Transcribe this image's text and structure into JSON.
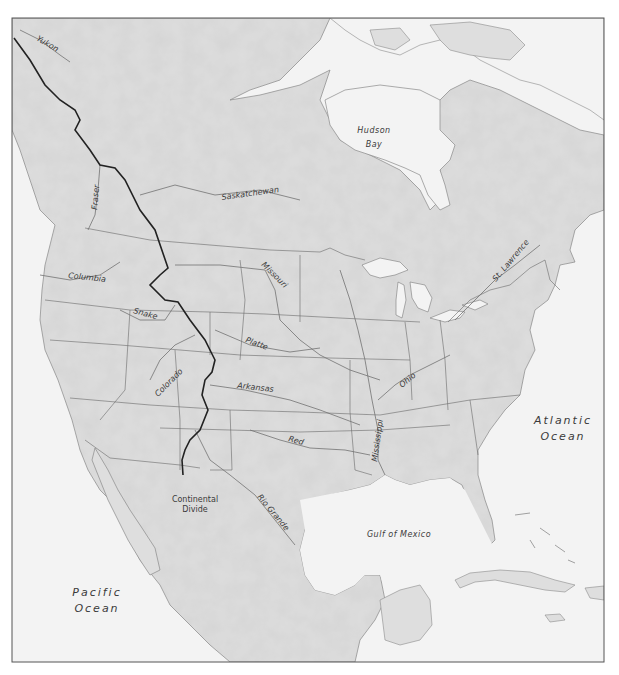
{
  "map": {
    "title": "North America physical map with rivers and Continental Divide",
    "colors": {
      "water": "#f3f3f3",
      "land": "#dcdcdc",
      "land_light": "#e6e6e6",
      "border": "#5a5a5a",
      "river": "#6e6e6e",
      "divide": "#222222",
      "frame": "#555555",
      "text": "#3a3a3a"
    },
    "labels": {
      "oceans": {
        "pacific_line1": "Pacific",
        "pacific_line2": "Ocean",
        "atlantic_line1": "Atlantic",
        "atlantic_line2": "Ocean"
      },
      "water_bodies": {
        "hudson_line1": "Hudson",
        "hudson_line2": "Bay",
        "gulf": "Gulf of Mexico"
      },
      "rivers": {
        "yukon": "Yukon",
        "fraser": "Fraser",
        "saskatchewan": "Saskatchewan",
        "columbia": "Columbia",
        "snake": "Snake",
        "missouri": "Missouri",
        "platte": "Platte",
        "colorado": "Colorado",
        "arkansas": "Arkansas",
        "red": "Red",
        "rio_grande": "Rio Grande",
        "mississippi": "Mississippi",
        "ohio": "Ohio",
        "st_lawrence": "St. Lawrence"
      },
      "features": {
        "divide_line1": "Continental",
        "divide_line2": "Divide"
      }
    }
  }
}
